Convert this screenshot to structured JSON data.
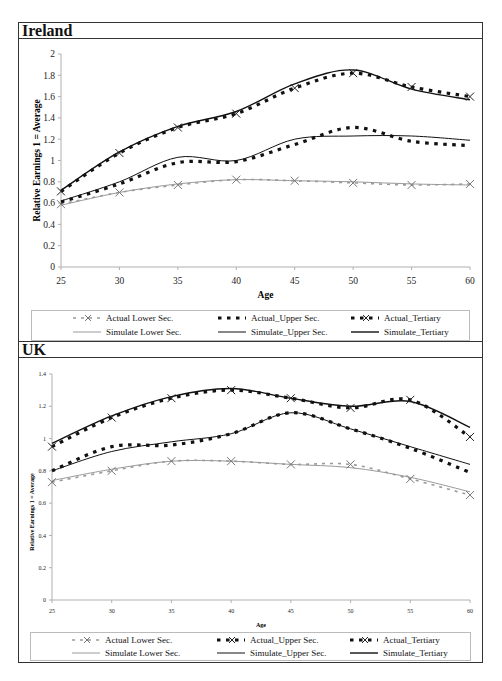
{
  "chart_data": [
    {
      "type": "line",
      "title": "Ireland",
      "xlabel": "Age",
      "ylabel": "Relative Earnings 1 = Average",
      "xlim": [
        25,
        60
      ],
      "ylim": [
        0,
        2
      ],
      "x_ticks": [
        25,
        30,
        35,
        40,
        45,
        50,
        55,
        60
      ],
      "y_ticks": [
        0,
        0.2,
        0.4,
        0.6,
        0.8,
        1,
        1.2,
        1.4,
        1.6,
        1.8,
        2
      ],
      "y_tick_labels": [
        "0",
        "0.2",
        "0.4",
        "0.6",
        "0.8",
        "1",
        "1.2",
        "1.4",
        "1.6",
        "1.8",
        "2"
      ],
      "grid": false,
      "legend_position": "bottom",
      "x": [
        25,
        30,
        35,
        40,
        45,
        50,
        55,
        60
      ],
      "series": [
        {
          "name": "Actual Lower Sec.",
          "style": "dashed-gray-x",
          "values": [
            0.59,
            0.7,
            0.77,
            0.82,
            0.81,
            0.79,
            0.77,
            0.78
          ]
        },
        {
          "name": "Actual_Upper Sec.",
          "style": "dashed-black",
          "values": [
            0.61,
            0.78,
            0.98,
            0.99,
            1.15,
            1.31,
            1.18,
            1.14
          ]
        },
        {
          "name": "Actual_Tertiary",
          "style": "dashed-black-x",
          "values": [
            0.71,
            1.07,
            1.31,
            1.44,
            1.68,
            1.82,
            1.69,
            1.6
          ]
        },
        {
          "name": "Simulate Lower Sec.",
          "style": "solid-gray",
          "values": [
            0.58,
            0.7,
            0.78,
            0.82,
            0.81,
            0.8,
            0.78,
            0.77
          ]
        },
        {
          "name": "Simulate_Upper Sec.",
          "style": "solid-black-thin",
          "values": [
            0.62,
            0.8,
            1.03,
            1.0,
            1.2,
            1.23,
            1.23,
            1.19
          ]
        },
        {
          "name": "Simulate_Tertiary",
          "style": "solid-black",
          "values": [
            0.72,
            1.08,
            1.32,
            1.46,
            1.72,
            1.85,
            1.67,
            1.57
          ]
        }
      ]
    },
    {
      "type": "line",
      "title": "UK",
      "xlabel": "Age",
      "ylabel": "Relative Earnings 1 = Average",
      "xlim": [
        25,
        60
      ],
      "ylim": [
        0,
        1.4
      ],
      "x_ticks": [
        25,
        30,
        35,
        40,
        45,
        50,
        55,
        60
      ],
      "y_ticks": [
        0,
        0.2,
        0.4,
        0.6,
        0.8,
        1,
        1.2,
        1.4
      ],
      "y_tick_labels": [
        "0",
        "0.2",
        "0.4",
        "0.6",
        "0.8",
        "1",
        "1.2",
        "1.4"
      ],
      "grid": false,
      "legend_position": "bottom",
      "x": [
        25,
        30,
        35,
        40,
        45,
        50,
        55,
        60
      ],
      "series": [
        {
          "name": "Actual Lower Sec.",
          "style": "dashed-gray-x",
          "values": [
            0.73,
            0.8,
            0.86,
            0.86,
            0.84,
            0.84,
            0.75,
            0.65
          ]
        },
        {
          "name": "Actual_Upper Sec.",
          "style": "dashed-black",
          "values": [
            0.8,
            0.95,
            0.96,
            1.03,
            1.16,
            1.06,
            0.94,
            0.79
          ]
        },
        {
          "name": "Actual_Tertiary",
          "style": "dashed-black-x",
          "values": [
            0.95,
            1.13,
            1.25,
            1.3,
            1.25,
            1.19,
            1.24,
            1.01
          ]
        },
        {
          "name": "Simulate Lower Sec.",
          "style": "solid-gray",
          "values": [
            0.74,
            0.81,
            0.86,
            0.86,
            0.84,
            0.82,
            0.76,
            0.67
          ]
        },
        {
          "name": "Simulate_Upper Sec.",
          "style": "solid-black-thin",
          "values": [
            0.8,
            0.92,
            0.98,
            1.03,
            1.16,
            1.06,
            0.95,
            0.84
          ]
        },
        {
          "name": "Simulate_Tertiary",
          "style": "solid-black",
          "values": [
            0.97,
            1.14,
            1.26,
            1.31,
            1.25,
            1.2,
            1.23,
            1.07
          ]
        }
      ]
    }
  ],
  "panels": {
    "ireland": {
      "title": "Ireland",
      "xlabel": "Age",
      "ylabel": "Relative Earnings 1 = Average"
    },
    "uk": {
      "title": "UK",
      "xlabel": "Age",
      "ylabel": "Relative Earnings 1 = Average"
    }
  },
  "legend": [
    {
      "label": "Actual Lower Sec.",
      "style": "dashed-gray-x"
    },
    {
      "label": "Actual_Upper Sec.",
      "style": "dashed-black"
    },
    {
      "label": "Actual_Tertiary",
      "style": "dashed-black-x"
    },
    {
      "label": "Simulate Lower Sec.",
      "style": "solid-gray"
    },
    {
      "label": "Simulate_Upper Sec.",
      "style": "solid-black-thin"
    },
    {
      "label": "Simulate_Tertiary",
      "style": "solid-black"
    }
  ],
  "colors": {
    "black": "#111111",
    "gray": "#9a9a9a",
    "frame": "#333333",
    "axis": "#b0b0b0"
  }
}
